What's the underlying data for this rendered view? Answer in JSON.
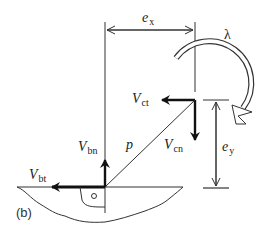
{
  "figure": {
    "panel_label": "(b)",
    "labels": {
      "ex": {
        "main": "e",
        "sub": "x"
      },
      "ey": {
        "main": "e",
        "sub": "y"
      },
      "lambda": "λ",
      "p": "p",
      "Vct": {
        "main": "V",
        "sub": "ct"
      },
      "Vcn": {
        "main": "V",
        "sub": "cn"
      },
      "Vbn": {
        "main": "V",
        "sub": "bn"
      },
      "Vbt": {
        "main": "V",
        "sub": "bt"
      }
    },
    "colors": {
      "line": "#333333",
      "thick": "#111111",
      "background": "#ffffff"
    }
  }
}
